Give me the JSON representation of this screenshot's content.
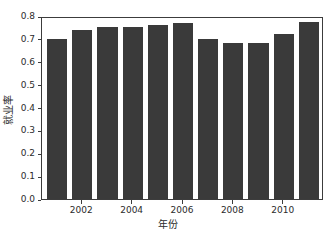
{
  "chart_data": {
    "type": "bar",
    "title": "",
    "xlabel": "年份",
    "ylabel": "就业率",
    "categories": [
      2001,
      2002,
      2003,
      2004,
      2005,
      2006,
      2007,
      2008,
      2009,
      2010,
      2011
    ],
    "values": [
      0.7,
      0.74,
      0.75,
      0.75,
      0.76,
      0.77,
      0.7,
      0.68,
      0.68,
      0.72,
      0.775
    ],
    "series": [
      {
        "name": "就业率",
        "values": [
          0.7,
          0.74,
          0.75,
          0.75,
          0.76,
          0.77,
          0.7,
          0.68,
          0.68,
          0.72,
          0.775
        ]
      }
    ],
    "ylim": [
      0.0,
      0.8
    ],
    "xlim": [
      2000.4,
      2011.6
    ],
    "y_ticks": [
      0.0,
      0.1,
      0.2,
      0.3,
      0.4,
      0.5,
      0.6,
      0.7,
      0.8
    ],
    "y_tick_labels": [
      "0.0",
      "0.1",
      "0.2",
      "0.3",
      "0.4",
      "0.5",
      "0.6",
      "0.7",
      "0.8"
    ],
    "x_ticks": [
      2002,
      2004,
      2006,
      2008,
      2010
    ],
    "x_tick_labels": [
      "2002",
      "2004",
      "2006",
      "2008",
      "2010"
    ],
    "grid": false,
    "legend": false,
    "legend_position": "none",
    "bar_color": "#3a3a3a",
    "axis_color": "#3c3c3c",
    "background_color": "#ffffff",
    "bar_width_fraction": 0.8
  }
}
